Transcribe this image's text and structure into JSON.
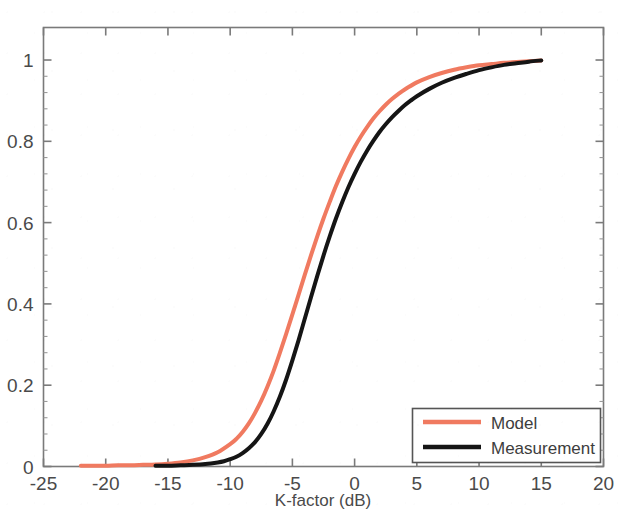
{
  "chart_data": {
    "type": "line",
    "title": "",
    "subtitle": "",
    "xlabel": "K-factor (dB)",
    "ylabel": "",
    "xlim": [
      -25,
      20
    ],
    "ylim": [
      0,
      1.08
    ],
    "xticks": [
      -25,
      -20,
      -15,
      -10,
      -5,
      0,
      5,
      10,
      15,
      20
    ],
    "xtick_labels": [
      "-25",
      "-20",
      "-15",
      "-10",
      "-5",
      "0",
      "5",
      "10",
      "15",
      "20"
    ],
    "yticks": [
      0,
      0.2,
      0.4,
      0.6,
      0.8,
      1
    ],
    "ytick_labels": [
      "0",
      "0.2",
      "0.4",
      "0.6",
      "0.8",
      "1"
    ],
    "minor_yticks_per_interval": 4,
    "grid": false,
    "legend_position": "lower right",
    "series": [
      {
        "name": "Model",
        "color": "#F07A60",
        "linewidth": 4,
        "x": [
          -22.0,
          -21.0,
          -20.0,
          -19.0,
          -18.0,
          -17.0,
          -16.0,
          -15.0,
          -14.0,
          -13.0,
          -12.0,
          -11.0,
          -10.0,
          -9.5,
          -9.0,
          -8.5,
          -8.0,
          -7.5,
          -7.0,
          -6.5,
          -6.0,
          -5.5,
          -5.0,
          -4.5,
          -4.0,
          -3.5,
          -3.0,
          -2.5,
          -2.0,
          -1.5,
          -1.0,
          -0.5,
          0.0,
          0.5,
          1.0,
          1.5,
          2.0,
          2.5,
          3.0,
          3.5,
          4.0,
          5.0,
          6.0,
          7.0,
          8.0,
          9.0,
          10.0,
          11.0,
          12.0,
          13.0,
          14.0,
          15.0
        ],
        "y": [
          0.002,
          0.002,
          0.002,
          0.003,
          0.003,
          0.004,
          0.005,
          0.007,
          0.01,
          0.015,
          0.023,
          0.035,
          0.055,
          0.068,
          0.085,
          0.106,
          0.132,
          0.162,
          0.197,
          0.236,
          0.28,
          0.326,
          0.374,
          0.423,
          0.472,
          0.52,
          0.566,
          0.61,
          0.651,
          0.69,
          0.725,
          0.757,
          0.786,
          0.812,
          0.835,
          0.856,
          0.874,
          0.89,
          0.904,
          0.916,
          0.927,
          0.945,
          0.958,
          0.968,
          0.976,
          0.982,
          0.987,
          0.99,
          0.993,
          0.995,
          0.997,
          0.999
        ]
      },
      {
        "name": "Measurement",
        "color": "#151515",
        "linewidth": 4,
        "x": [
          -16.0,
          -15.0,
          -14.0,
          -13.0,
          -12.0,
          -11.0,
          -10.5,
          -10.0,
          -9.5,
          -9.0,
          -8.5,
          -8.0,
          -7.5,
          -7.0,
          -6.5,
          -6.0,
          -5.5,
          -5.0,
          -4.5,
          -4.0,
          -3.5,
          -3.0,
          -2.5,
          -2.0,
          -1.5,
          -1.0,
          -0.5,
          0.0,
          0.5,
          1.0,
          1.5,
          2.0,
          2.5,
          3.0,
          3.5,
          4.0,
          4.5,
          5.0,
          6.0,
          7.0,
          8.0,
          9.0,
          10.0,
          11.0,
          12.0,
          13.0,
          14.0,
          15.0
        ],
        "y": [
          0.002,
          0.002,
          0.003,
          0.004,
          0.006,
          0.01,
          0.013,
          0.018,
          0.024,
          0.033,
          0.045,
          0.06,
          0.08,
          0.105,
          0.136,
          0.172,
          0.214,
          0.261,
          0.311,
          0.364,
          0.417,
          0.469,
          0.519,
          0.566,
          0.61,
          0.65,
          0.687,
          0.72,
          0.75,
          0.777,
          0.801,
          0.823,
          0.842,
          0.859,
          0.874,
          0.888,
          0.9,
          0.911,
          0.929,
          0.944,
          0.956,
          0.966,
          0.975,
          0.982,
          0.988,
          0.992,
          0.996,
          0.999
        ]
      }
    ],
    "legend": [
      {
        "label": "Model",
        "color": "#F07A60"
      },
      {
        "label": "Measurement",
        "color": "#151515"
      }
    ]
  },
  "axes": {
    "frame_color": "#7a7a7a"
  }
}
